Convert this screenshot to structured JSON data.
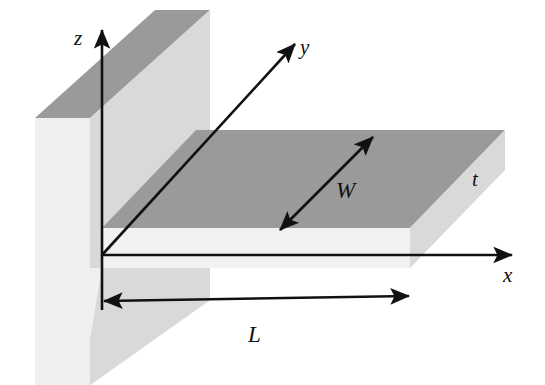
{
  "figure": {
    "background_color": "#ffffff"
  },
  "axes": [
    {
      "id": "z",
      "label": "z",
      "direction": "up",
      "label_x": 82,
      "label_y": 40
    },
    {
      "id": "y",
      "label": "y",
      "direction": "up-right-diagonal",
      "label_x": 305,
      "label_y": 52
    },
    {
      "id": "x",
      "label": "x",
      "direction": "right",
      "label_x": 508,
      "label_y": 280
    }
  ],
  "dimensions": [
    {
      "id": "W",
      "label": "W",
      "kind": "double-arrow",
      "label_x": 318,
      "label_y": 200,
      "description": "beam width across top face"
    },
    {
      "id": "L",
      "label": "L",
      "kind": "double-arrow",
      "label_x": 255,
      "label_y": 340,
      "description": "beam length along x"
    },
    {
      "id": "t",
      "label": "t",
      "kind": "text-only",
      "label_x": 478,
      "label_y": 185,
      "description": "beam thickness at free end"
    }
  ],
  "colors": {
    "face_top_dark": "#9a9a9a",
    "face_side_light": "#d9d9d9",
    "face_front_pale": "#f1f1f1",
    "face_wall_front": "#efefef",
    "stroke": "#111111",
    "background": "#ffffff"
  },
  "geometry": {
    "origin": {
      "x": 102,
      "y": 255
    },
    "beam": {
      "length_px": 308,
      "description": "Horizontal slab extending in +x from the wall, top face shaded dark gray, front and end faces pale."
    },
    "wall": {
      "description": "Vertical support slab at left, clamped end of the cantilever."
    }
  }
}
